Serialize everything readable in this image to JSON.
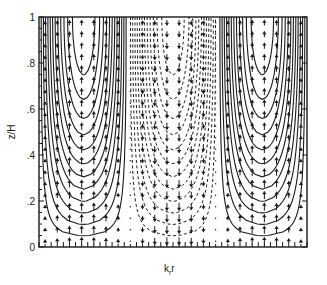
{
  "chart_data": {
    "type": "contour",
    "title": "",
    "xlabel": "k_r r",
    "xlabel_main": "k",
    "xlabel_sub": "r",
    "xlabel_tail": "r",
    "ylabel": "z/H",
    "ylim": [
      0,
      1
    ],
    "yticks": [
      {
        "value": 0,
        "label": "0"
      },
      {
        "value": 0.2,
        "label": ".2"
      },
      {
        "value": 0.4,
        "label": ".4"
      },
      {
        "value": 0.6,
        "label": ".6"
      },
      {
        "value": 0.8,
        "label": ".8"
      },
      {
        "value": 1,
        "label": "1"
      }
    ],
    "xticks_labeled": false,
    "grid": false,
    "legend": null,
    "regions": [
      {
        "name": "left-cell",
        "x_range_fraction": [
          0.0,
          0.33
        ],
        "contour_style": "solid",
        "flow": "upward"
      },
      {
        "name": "center-cell",
        "x_range_fraction": [
          0.33,
          0.67
        ],
        "contour_style": "dashed",
        "flow": "downward"
      },
      {
        "name": "right-cell",
        "x_range_fraction": [
          0.67,
          1.0
        ],
        "contour_style": "solid",
        "flow": "upward"
      }
    ],
    "contour_levels_per_cell": 12,
    "vector_columns": 22,
    "vector_rows": 20
  },
  "frame": {
    "x0": 39,
    "y0": 17,
    "x1": 307,
    "y1": 247
  }
}
